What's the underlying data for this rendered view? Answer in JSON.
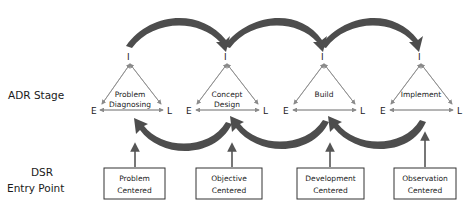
{
  "diagram": {
    "row_labels": {
      "adr": "ADR Stage",
      "dsr_line1": "DSR",
      "dsr_line2": "Entry Point"
    },
    "stages": [
      {
        "line1": "Problem",
        "line2": "Diagnosing",
        "apex": "I",
        "left": "E",
        "right": "L"
      },
      {
        "line1": "Concept",
        "line2": "Design",
        "apex": "I",
        "left": "E",
        "right": "L"
      },
      {
        "line1": "Build",
        "line2": "",
        "apex": "I",
        "left": "E",
        "right": "L"
      },
      {
        "line1": "Implement",
        "line2": "",
        "apex": "I",
        "left": "E",
        "right": "L"
      }
    ],
    "entry_points": [
      {
        "line1": "Problem",
        "line2": "Centered",
        "targets_stage": "Problem Diagnosing"
      },
      {
        "line1": "Objective",
        "line2": "Centered",
        "targets_stage": "Concept Design"
      },
      {
        "line1": "Development",
        "line2": "Centered",
        "targets_stage": "Build"
      },
      {
        "line1": "Observation",
        "line2": "Centered",
        "targets_stage": "Implement"
      }
    ],
    "forward_arrows": [
      "Problem Diagnosing -> Concept Design",
      "Concept Design -> Build",
      "Build -> Implement"
    ],
    "backward_arrows": [
      "Concept Design -> Problem Diagnosing",
      "Build -> Concept Design",
      "Implement -> Build"
    ],
    "colors": {
      "arrow_fill": "#555555",
      "arrow_dark": "#3a3a3a",
      "line": "#8a8a8a",
      "box_border": "#333333",
      "text": "#1a1a1a"
    }
  }
}
